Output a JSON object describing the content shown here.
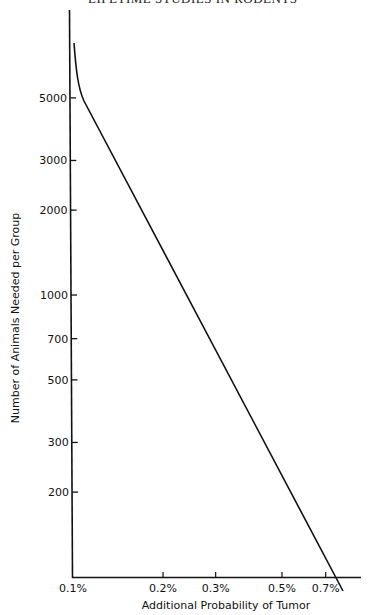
{
  "header": {
    "running_title": "LIFETIME STUDIES IN RODENTS"
  },
  "chart_data": {
    "type": "line",
    "title": "",
    "xlabel": "Additional Probability of Tumor",
    "ylabel": "Number of Animals Needed per Group",
    "xscale": "log",
    "yscale": "log",
    "xlim": [
      0.1,
      0.85
    ],
    "ylim": [
      100,
      8000
    ],
    "x_ticks": [
      {
        "value": 0.1,
        "label": "0.1%"
      },
      {
        "value": 0.2,
        "label": "0.2%"
      },
      {
        "value": 0.3,
        "label": "0.3%"
      },
      {
        "value": 0.5,
        "label": "0.5%"
      },
      {
        "value": 0.7,
        "label": "0.7%"
      }
    ],
    "y_ticks": [
      {
        "value": 5000,
        "label": "5000"
      },
      {
        "value": 3000,
        "label": "3000"
      },
      {
        "value": 2000,
        "label": "2000"
      },
      {
        "value": 1000,
        "label": "1000"
      },
      {
        "value": 700,
        "label": "700"
      },
      {
        "value": 500,
        "label": "500"
      },
      {
        "value": 300,
        "label": "300"
      },
      {
        "value": 200,
        "label": "200"
      }
    ],
    "grid": false,
    "legend": null,
    "series": [
      {
        "name": "Animals needed",
        "x": [
          0.101,
          0.11,
          0.115,
          0.2,
          0.3,
          0.5,
          0.7,
          0.77
        ],
        "y": [
          7400,
          5100,
          4700,
          1850,
          860,
          310,
          125,
          100
        ]
      }
    ]
  }
}
